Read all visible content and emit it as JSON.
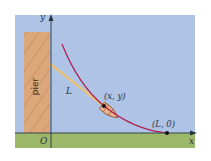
{
  "figure": {
    "colors": {
      "sky": "#aec3e6",
      "ground": "#9cb86a",
      "pier_fill": "#dca77a",
      "pier_hatch": "#c48c5e",
      "curve": "#b0184a",
      "rope": "#e8c27a",
      "axis": "#2a3340",
      "boat_fill": "#e9b58a"
    },
    "labels": {
      "y_axis": "y",
      "x_axis": "x",
      "origin": "O",
      "pier": "pier",
      "segment": "L",
      "point_xy": "(x, y)",
      "point_L0": "(L, 0)"
    }
  }
}
